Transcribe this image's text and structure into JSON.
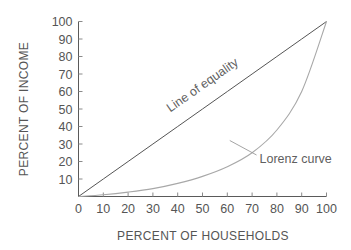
{
  "chart_data": {
    "type": "line",
    "title": "",
    "xlabel": "PERCENT OF HOUSEHOLDS",
    "ylabel": "PERCENT OF INCOME",
    "xlim": [
      0,
      100
    ],
    "ylim": [
      0,
      100
    ],
    "grid": false,
    "legend_position": "inline-annotations",
    "x_ticks": [
      "0",
      "10",
      "20",
      "30",
      "40",
      "50",
      "60",
      "70",
      "80",
      "90",
      "100"
    ],
    "x_tick_values": [
      0,
      10,
      20,
      30,
      40,
      50,
      60,
      70,
      80,
      90,
      100
    ],
    "y_ticks": [
      "10",
      "20",
      "30",
      "40",
      "50",
      "60",
      "70",
      "80",
      "90",
      "100"
    ],
    "y_tick_values": [
      10,
      20,
      30,
      40,
      50,
      60,
      70,
      80,
      90,
      100
    ],
    "series": [
      {
        "name": "Line of equality",
        "color": "#555555",
        "label_rotation_deg": -35,
        "x": [
          0,
          10,
          20,
          30,
          40,
          50,
          60,
          70,
          80,
          90,
          100
        ],
        "values": [
          0,
          10,
          20,
          30,
          40,
          50,
          60,
          70,
          80,
          90,
          100
        ]
      },
      {
        "name": "Lorenz curve",
        "color": "#a8a8a8",
        "label_rotation_deg": 0,
        "x": [
          0,
          10,
          20,
          30,
          40,
          50,
          60,
          70,
          80,
          90,
          100
        ],
        "values": [
          0,
          1,
          2.5,
          4.5,
          7.5,
          11.5,
          17,
          25,
          38,
          60,
          100
        ]
      }
    ],
    "annotations": [
      {
        "text": "Line of equality",
        "at_x": 37,
        "at_y": 48,
        "style": "rotated-along-line"
      },
      {
        "text": "Lorenz curve",
        "at_x": 73,
        "at_y": 22,
        "style": "leader-line",
        "leader_from_x": 61,
        "leader_from_y": 32
      }
    ]
  }
}
